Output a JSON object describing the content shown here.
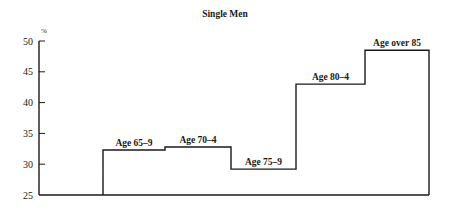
{
  "chart_data": {
    "type": "line",
    "subtype": "step",
    "title": "Single Men",
    "xlabel": "",
    "ylabel": "%",
    "ylim": [
      25,
      50
    ],
    "yticks": [
      25,
      30,
      35,
      40,
      45,
      50
    ],
    "grid": false,
    "legend": null,
    "categories": [
      "Age 65–9",
      "Age 70–4",
      "Age 75–9",
      "Age 80–4",
      "Age over 85"
    ],
    "values": [
      32.3,
      32.8,
      29.2,
      43.0,
      48.5
    ]
  }
}
